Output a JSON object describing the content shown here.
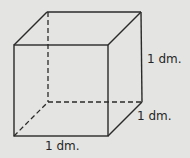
{
  "figure": {
    "type": "cube",
    "colors": {
      "background": "#e4e4e2",
      "line": "#2a2a2a"
    },
    "labels": {
      "height": "1 dm.",
      "depth": "1 dm.",
      "width": "1 dm."
    }
  }
}
